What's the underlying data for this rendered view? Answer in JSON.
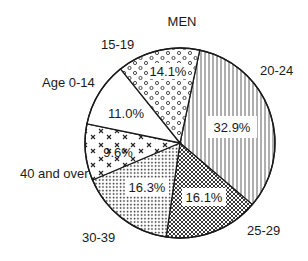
{
  "chart_data": {
    "type": "pie",
    "title": "MEN",
    "categories": [
      "20-24",
      "25-29",
      "30-39",
      "40 and over",
      "Age 0-14",
      "15-19"
    ],
    "values": [
      32.9,
      16.1,
      16.3,
      9.6,
      11.0,
      14.1
    ],
    "value_labels": [
      "32.9%",
      "16.1%",
      "16.3%",
      "9.6%",
      "11.0%",
      "14.1%"
    ],
    "unit": "%",
    "start_angle_deg_clockwise_from_top": 12,
    "direction": "clockwise",
    "patterns": [
      "vertical-lines",
      "crosshatch",
      "fine-dots",
      "x-marks",
      "blank",
      "open-circles"
    ],
    "legend": "none (direct labels outside slices)"
  },
  "labels": {
    "title": "MEN",
    "s0": "20-24",
    "s1": "25-29",
    "s2": "30-39",
    "s3": "40 and over",
    "s4": "Age 0-14",
    "s5": "15-19",
    "p0": "32.9%",
    "p1": "16.1%",
    "p2": "16.3%",
    "p3": "9.6%",
    "p4": "11.0%",
    "p5": "14.1%"
  },
  "colors": {
    "ink": "#1a1a1a",
    "background": "#ffffff"
  }
}
